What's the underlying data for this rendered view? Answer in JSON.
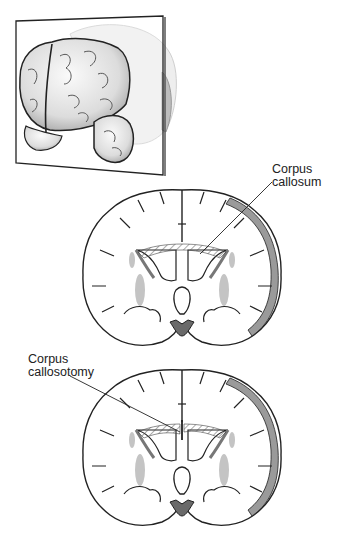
{
  "figure": {
    "panels": [
      {
        "id": "brain-3d",
        "description": "3D brain with coronal cutting plane"
      },
      {
        "id": "coronal-intact",
        "description": "Coronal section with intact corpus callosum"
      },
      {
        "id": "coronal-cut",
        "description": "Coronal section after corpus callosotomy"
      }
    ],
    "labels": {
      "callosum": {
        "line1": "Corpus",
        "line2": "callosum"
      },
      "callosotomy": {
        "line1": "Corpus",
        "line2": "callosotomy"
      }
    },
    "colors": {
      "outline": "#222222",
      "gray_matter": "#b9b9b9",
      "hatch": "#555555",
      "brain_shade": "#d8d8d8",
      "background": "#ffffff"
    }
  }
}
